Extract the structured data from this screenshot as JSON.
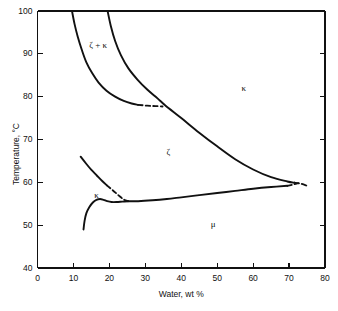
{
  "figure": {
    "title": "",
    "background_color": "#ffffff",
    "line_color": "#111111"
  },
  "axes": {
    "x": {
      "label": "Water, wt %",
      "min": 0,
      "max": 80,
      "ticks": [
        0,
        10,
        20,
        30,
        40,
        50,
        60,
        70,
        80
      ],
      "tick_labels": [
        "0",
        "10",
        "20",
        "30",
        "40",
        "50",
        "60",
        "70",
        "80"
      ]
    },
    "y": {
      "label": "Temperature, °C",
      "min": 40,
      "max": 100,
      "ticks": [
        40,
        50,
        60,
        70,
        80,
        90,
        100
      ],
      "tick_labels": [
        "40",
        "50",
        "60",
        "70",
        "80",
        "90",
        "100"
      ]
    }
  },
  "phase_labels": [
    {
      "id": "zeta-plus-kappa",
      "text": "ζ + κ",
      "x": 15.5,
      "y": 91.5
    },
    {
      "id": "kappa-upper-right",
      "text": "κ",
      "x": 56.0,
      "y": 81.5
    },
    {
      "id": "zeta",
      "text": "ζ",
      "x": 35.0,
      "y": 66.5
    },
    {
      "id": "kappa-left",
      "text": "κ",
      "x": 15.0,
      "y": 56.5
    },
    {
      "id": "mu",
      "text": "μ",
      "x": 47.5,
      "y": 49.8
    }
  ],
  "chart_data": {
    "type": "line",
    "title": "",
    "xlabel": "Water, wt %",
    "ylabel": "Temperature, °C",
    "xlim": [
      0,
      80
    ],
    "ylim": [
      40,
      100
    ],
    "grid": false,
    "legend": "none",
    "series": [
      {
        "name": "zeta-kappa-left-boundary",
        "style": "solid",
        "points": [
          [
            9.6,
            100.0
          ],
          [
            10.3,
            97.0
          ],
          [
            11.2,
            94.0
          ],
          [
            12.3,
            91.0
          ],
          [
            13.6,
            88.0
          ],
          [
            15.2,
            85.5
          ],
          [
            17.0,
            83.3
          ],
          [
            19.2,
            81.4
          ],
          [
            21.6,
            80.0
          ],
          [
            24.0,
            79.0
          ],
          [
            26.2,
            78.4
          ],
          [
            28.0,
            78.1
          ]
        ]
      },
      {
        "name": "zeta-kappa-left-boundary-dashed",
        "style": "dashed",
        "points": [
          [
            28.0,
            78.1
          ],
          [
            30.5,
            77.9
          ],
          [
            32.8,
            77.8
          ],
          [
            34.8,
            77.7
          ]
        ]
      },
      {
        "name": "kappa-liquidus-upper",
        "style": "solid",
        "points": [
          [
            19.5,
            100.0
          ],
          [
            20.4,
            96.5
          ],
          [
            21.6,
            93.0
          ],
          [
            23.2,
            89.7
          ],
          [
            25.3,
            86.6
          ],
          [
            27.8,
            84.0
          ],
          [
            30.6,
            81.6
          ],
          [
            33.4,
            79.6
          ],
          [
            35.5,
            78.0
          ],
          [
            40.0,
            75.0
          ],
          [
            45.0,
            71.6
          ],
          [
            50.0,
            68.4
          ],
          [
            55.0,
            65.4
          ],
          [
            60.0,
            63.0
          ],
          [
            65.0,
            61.2
          ],
          [
            69.5,
            60.2
          ],
          [
            71.5,
            59.9
          ]
        ]
      },
      {
        "name": "kappa-liquidus-upper-dashed",
        "style": "dashed",
        "points": [
          [
            71.5,
            59.9
          ],
          [
            73.2,
            59.7
          ],
          [
            75.0,
            59.2
          ]
        ]
      },
      {
        "name": "zeta-kappa-lower-boundary",
        "style": "solid",
        "points": [
          [
            12.0,
            66.0
          ],
          [
            13.5,
            64.4
          ],
          [
            15.0,
            62.9
          ],
          [
            16.5,
            61.6
          ],
          [
            18.0,
            60.3
          ],
          [
            19.3,
            59.3
          ]
        ]
      },
      {
        "name": "zeta-kappa-lower-boundary-dashed",
        "style": "dashed",
        "points": [
          [
            19.3,
            59.3
          ],
          [
            21.0,
            58.1
          ],
          [
            22.5,
            57.0
          ],
          [
            24.0,
            56.0
          ],
          [
            25.2,
            55.6
          ]
        ]
      },
      {
        "name": "mu-solvus",
        "style": "solid",
        "points": [
          [
            25.2,
            55.6
          ],
          [
            28.0,
            55.6
          ],
          [
            32.0,
            55.8
          ],
          [
            36.0,
            56.1
          ],
          [
            40.0,
            56.5
          ],
          [
            45.0,
            57.0
          ],
          [
            50.0,
            57.5
          ],
          [
            55.0,
            58.0
          ],
          [
            60.0,
            58.5
          ],
          [
            65.0,
            58.9
          ],
          [
            69.5,
            59.2
          ]
        ]
      },
      {
        "name": "mu-solvus-dashed",
        "style": "dashed",
        "points": [
          [
            69.5,
            59.2
          ],
          [
            71.2,
            59.5
          ],
          [
            72.6,
            59.8
          ]
        ]
      },
      {
        "name": "kappa-dome",
        "style": "solid",
        "points": [
          [
            12.8,
            49.0
          ],
          [
            13.1,
            51.0
          ],
          [
            13.6,
            52.8
          ],
          [
            14.4,
            54.2
          ],
          [
            15.4,
            55.3
          ],
          [
            16.4,
            55.9
          ],
          [
            17.4,
            56.1
          ],
          [
            18.4,
            55.9
          ],
          [
            19.4,
            55.6
          ],
          [
            20.6,
            55.4
          ],
          [
            22.0,
            55.4
          ],
          [
            23.6,
            55.5
          ],
          [
            25.2,
            55.6
          ]
        ]
      }
    ]
  }
}
